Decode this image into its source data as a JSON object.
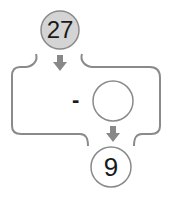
{
  "diagram": {
    "start_value": "27",
    "operator": "-",
    "operand_blank": "",
    "result_value": "9",
    "colors": {
      "start_fill": "#d4d4d4",
      "stroke": "#8a8a8a",
      "arrow": "#888888",
      "text": "#1a1a1a"
    }
  }
}
